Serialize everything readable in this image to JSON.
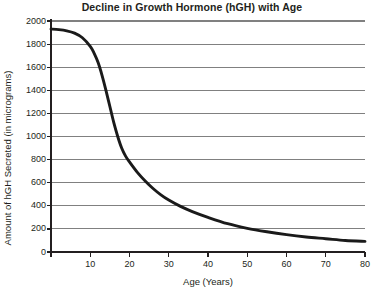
{
  "chart_data": {
    "type": "line",
    "title": "Decline in Growth Hormone (hGH) with Age",
    "xlabel": "Age (Years)",
    "ylabel": "Amount of hGH Secreted (in micrograms)",
    "xlim": [
      0,
      80
    ],
    "ylim": [
      0,
      2000
    ],
    "xticks": [
      0,
      10,
      20,
      30,
      40,
      50,
      60,
      70,
      80
    ],
    "yticks": [
      0,
      200,
      400,
      600,
      800,
      1000,
      1200,
      1400,
      1600,
      1800,
      2000
    ],
    "xtick_labels": [
      "0",
      "10",
      "20",
      "30",
      "40",
      "50",
      "60",
      "70",
      "80"
    ],
    "ytick_labels": [
      "0",
      "200",
      "400",
      "600",
      "800",
      "1000",
      "1200",
      "1400",
      "1600",
      "1800",
      "2000"
    ],
    "grid": "horizontal",
    "legend": "none",
    "series": [
      {
        "name": "hGH secreted",
        "color": "#1a1a1a",
        "x": [
          0,
          2,
          4,
          6,
          8,
          10,
          11,
          12,
          13,
          14,
          15,
          16,
          17,
          18,
          19,
          20,
          22,
          24,
          26,
          28,
          30,
          33,
          36,
          40,
          45,
          50,
          55,
          60,
          65,
          70,
          75,
          80
        ],
        "y": [
          1930,
          1925,
          1915,
          1895,
          1855,
          1780,
          1720,
          1640,
          1530,
          1400,
          1260,
          1120,
          1000,
          900,
          830,
          780,
          690,
          615,
          550,
          495,
          450,
          395,
          350,
          300,
          245,
          205,
          175,
          150,
          130,
          115,
          100,
          92
        ]
      }
    ]
  },
  "colors": {
    "gridline": "#808080",
    "axis": "#231f20",
    "curve": "#1a1a1a",
    "background": "#ffffff",
    "text": "#231f20"
  },
  "plot_geometry": {
    "left": 51,
    "right": 365,
    "top": 21,
    "bottom": 252
  }
}
